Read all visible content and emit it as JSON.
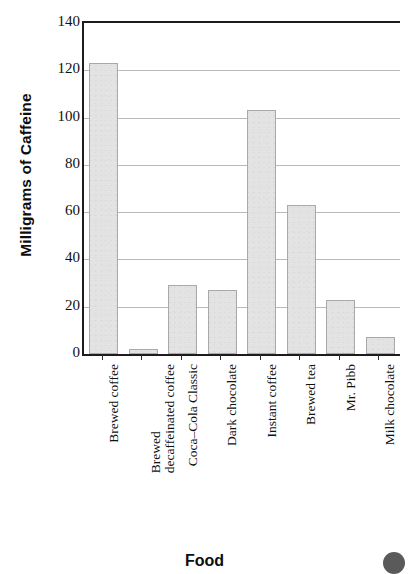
{
  "chart_data": {
    "type": "bar",
    "title": "",
    "xlabel": "Food",
    "ylabel": "Milligrams of Caffeine",
    "categories": [
      "Brewed coffee",
      "Brewed decaffeinated coffee",
      "Coca–Cola Classic",
      "Dark chocolate",
      "Instant coffee",
      "Brewed tea",
      "Mr. Pibb",
      "Milk chocolate"
    ],
    "category_lines": [
      [
        "Brewed coffee"
      ],
      [
        "Brewed",
        "decaffeinated coffee"
      ],
      [
        "Coca–Cola Classic"
      ],
      [
        "Dark chocolate"
      ],
      [
        "Instant coffee"
      ],
      [
        "Brewed tea"
      ],
      [
        "Mr. Pibb"
      ],
      [
        "Milk chocolate"
      ]
    ],
    "values": [
      123,
      2,
      29,
      27,
      103,
      63,
      23,
      7
    ],
    "ylim": [
      0,
      140
    ],
    "yticks": [
      0,
      20,
      40,
      60,
      80,
      100,
      120,
      140
    ],
    "ytick_labels": [
      "0",
      "20",
      "40",
      "60",
      "80",
      "100",
      "120",
      "140"
    ],
    "grid": true,
    "grid_axis": "y",
    "legend": null,
    "bar_color": "#e3e3e3",
    "bar_edge_color": "#a9a9a9",
    "axis_color": "#1c1c1c",
    "grid_color": "#b9b9b9"
  }
}
